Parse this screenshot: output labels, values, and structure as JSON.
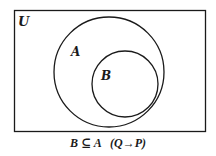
{
  "diagram": {
    "type": "venn",
    "universe": {
      "label": "U",
      "x": 14,
      "y": 10,
      "width": 191,
      "height": 121
    },
    "sets": [
      {
        "id": "A",
        "label": "A",
        "cx": 109,
        "cy": 72,
        "r": 55,
        "label_x": 71,
        "label_y": 55
      },
      {
        "id": "B",
        "label": "B",
        "cx": 125,
        "cy": 84,
        "r": 33,
        "label_x": 101,
        "label_y": 79
      }
    ],
    "relation": "B subset of A",
    "caption": "B ⊆ A   (Q→P)",
    "colors": {
      "stroke": "#1a1a1a",
      "background": "#ffffff"
    }
  }
}
